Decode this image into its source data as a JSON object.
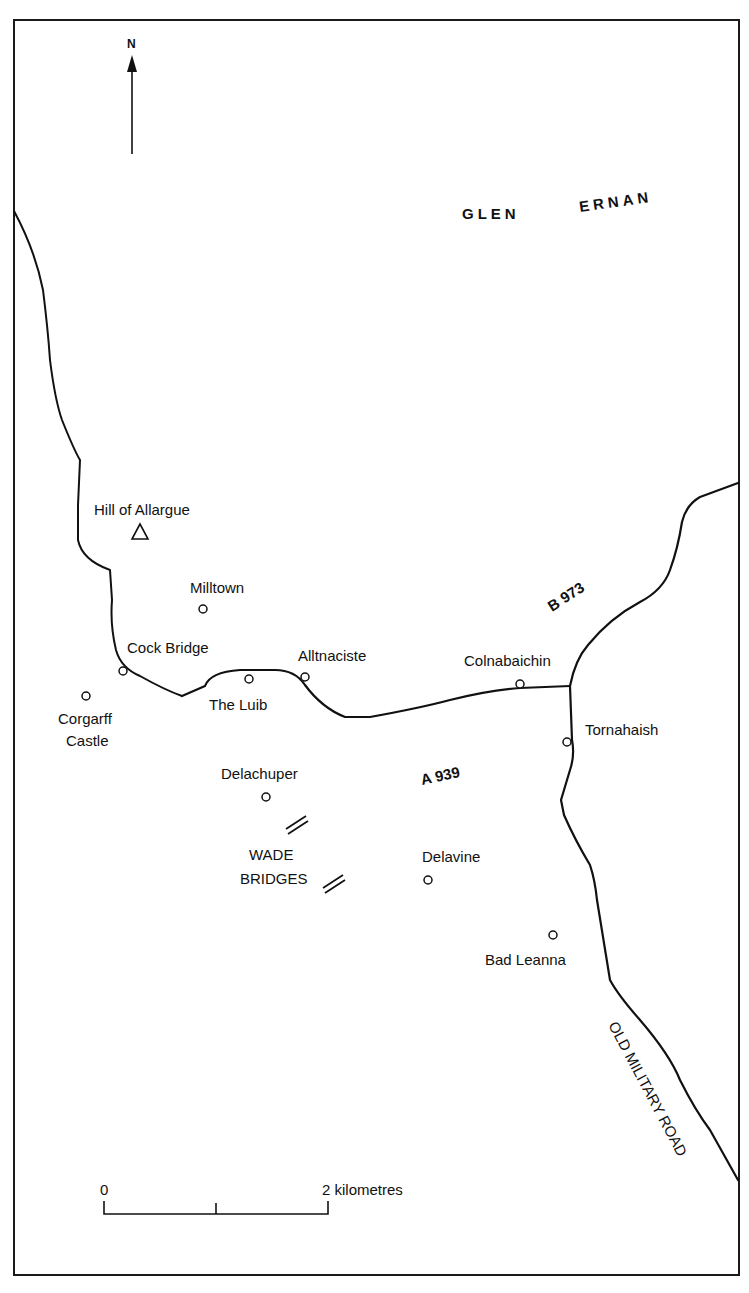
{
  "map": {
    "frame": {
      "x": 14,
      "y": 20,
      "width": 725,
      "height": 1255
    },
    "north_arrow": {
      "label": "N",
      "x": 132,
      "top": 50,
      "bottom": 154
    },
    "region_label": {
      "words": [
        {
          "text": "GLEN",
          "x": 462,
          "y": 219,
          "rotate": 0
        },
        {
          "text": "ERNAN",
          "x": 580,
          "y": 212,
          "rotate": -8
        }
      ]
    },
    "summits": [
      {
        "name": "Hill of Allargue",
        "x": 140,
        "y": 532,
        "label_x": 94,
        "label_y": 515
      }
    ],
    "places": [
      {
        "name": "Milltown",
        "x": 203,
        "y": 609,
        "label_lines": [
          "Milltown"
        ],
        "label_x": 190,
        "label_y": 593
      },
      {
        "name": "Cock Bridge",
        "x": 123,
        "y": 671,
        "label_lines": [
          "Cock Bridge"
        ],
        "label_x": 127,
        "label_y": 653
      },
      {
        "name": "Corgarff Castle",
        "x": 86,
        "y": 696,
        "label_lines": [
          "Corgarff",
          "Castle"
        ],
        "label_x": 60,
        "label_y": 724
      },
      {
        "name": "The Luib",
        "x": 249,
        "y": 679,
        "label_lines": [
          "The Luib"
        ],
        "label_x": 210,
        "label_y": 710
      },
      {
        "name": "Alltnaciste",
        "x": 305,
        "y": 677,
        "label_lines": [
          "Alltnaciste"
        ],
        "label_x": 298,
        "label_y": 661
      },
      {
        "name": "Colnabaichin",
        "x": 520,
        "y": 684,
        "label_lines": [
          "Colnabaichin"
        ],
        "label_x": 464,
        "label_y": 666
      },
      {
        "name": "Tornahaish",
        "x": 567,
        "y": 742,
        "label_lines": [
          "Tornahaish"
        ],
        "label_x": 585,
        "label_y": 735
      },
      {
        "name": "Delachuper",
        "x": 266,
        "y": 797,
        "label_lines": [
          "Delachuper"
        ],
        "label_x": 221,
        "label_y": 779
      },
      {
        "name": "Delavine",
        "x": 428,
        "y": 880,
        "label_lines": [
          "Delavine"
        ],
        "label_x": 422,
        "label_y": 862
      },
      {
        "name": "Bad Leanna",
        "x": 553,
        "y": 935,
        "label_lines": [
          "Bad Leanna"
        ],
        "label_x": 485,
        "label_y": 965
      }
    ],
    "features": [
      {
        "name": "Wade Bridges",
        "label_lines": [
          "WADE",
          "BRIDGES"
        ],
        "label_x": 273,
        "label_y": 860,
        "marks": [
          {
            "x": 295,
            "y": 826,
            "angle": -35
          },
          {
            "x": 335,
            "y": 885,
            "angle": -35
          }
        ]
      }
    ],
    "roads": [
      {
        "id": "A 939",
        "label": "A 939",
        "label_x": 422,
        "label_y": 785,
        "label_rotate": -12,
        "path": "M 182 696 L 205 686 Q 210 672 240 670 L 275 670 Q 295 670 305 685 Q 322 708 345 717 L 370 717 Q 420 708 450 700 Q 490 690 520 688 L 570 686"
      },
      {
        "id": "B 973",
        "label": "B 973",
        "label_x": 552,
        "label_y": 610,
        "label_rotate": -33,
        "path": "M 570 686 Q 575 660 588 645 Q 610 618 640 602 Q 663 590 670 570 Q 678 548 682 522 Q 686 505 700 497 L 738 483"
      },
      {
        "id": "Old Military Road",
        "label": "OLD MILITARY ROAD",
        "label_x": 608,
        "label_y": 1030,
        "label_rotate": 62,
        "path": "M 570 686 L 572 740 Q 575 755 570 770 L 561 800 L 564 815 Q 575 840 590 865 Q 595 880 597 900 L 610 980 Q 618 995 640 1020 Q 670 1055 680 1080 Q 695 1110 710 1130 L 738 1180"
      },
      {
        "id": "Western track",
        "label": "",
        "label_x": 0,
        "label_y": 0,
        "label_rotate": 0,
        "path": "M 14 211 Q 35 250 43 290 Q 48 330 50 360 Q 55 400 62 420 Q 74 450 80 460 L 78 505 L 78 540 Q 82 560 110 570 L 112 600 Q 110 625 116 650 Q 121 668 140 676 Q 165 690 182 696"
      }
    ],
    "scale_bar": {
      "x_start": 104,
      "x_mid": 216,
      "x_end": 328,
      "y": 1214,
      "tick_top": 1200,
      "labels": [
        {
          "text": "0",
          "x": 100,
          "y": 1195
        },
        {
          "text": "2 kilometres",
          "x": 322,
          "y": 1195
        }
      ]
    }
  }
}
